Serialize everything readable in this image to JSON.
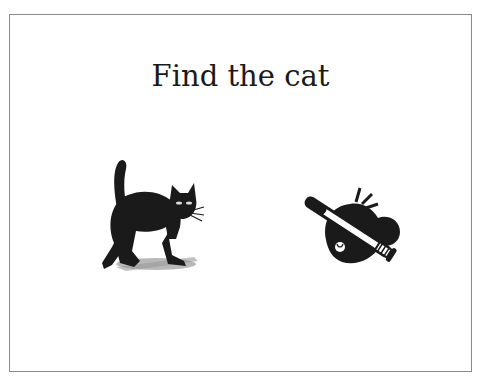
{
  "slide": {
    "title": "Find the cat",
    "images": [
      {
        "id": "cat",
        "label": "black cat with arched back",
        "icon": "cat-icon"
      },
      {
        "id": "bat",
        "label": "baseball bat over cap",
        "icon": "baseball-bat-icon"
      }
    ]
  },
  "colors": {
    "border": "#8a8a8a",
    "ink": "#1a1a1a",
    "shadow": "#9a9a9a"
  }
}
